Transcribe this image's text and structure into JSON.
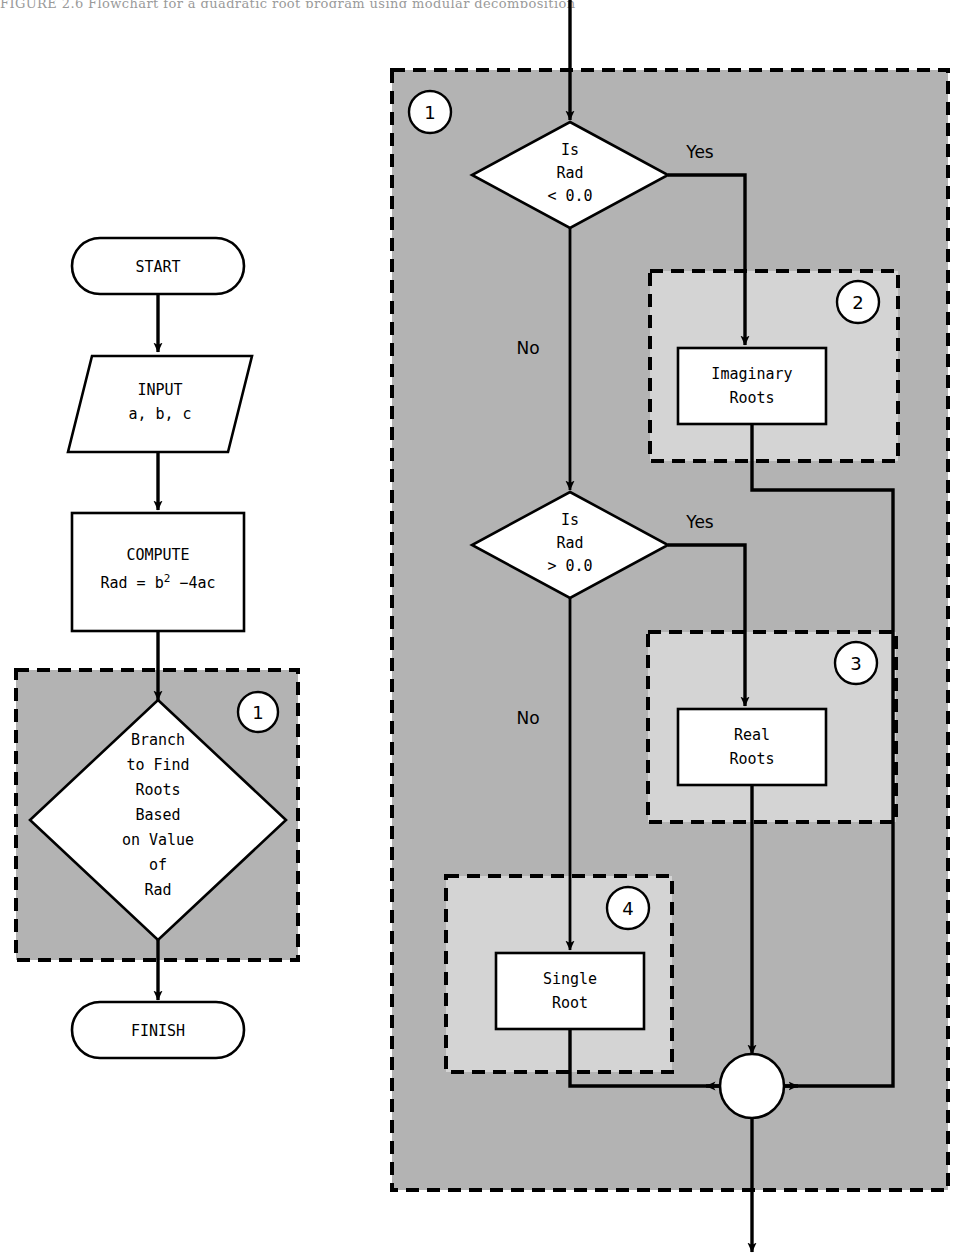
{
  "figure": {
    "caption_sliver": "FIGURE 2.6   Flowchart for a quadratic root program using modular decomposition",
    "background_color": "#ffffff",
    "region_dark_color": "#b3b3b3",
    "region_light_color": "#d4d4d4",
    "line_color": "#000000"
  },
  "left_chart": {
    "name": "top-level-flowchart",
    "nodes": {
      "start": {
        "label": "START",
        "shape": "terminator"
      },
      "input": {
        "label_line1": "INPUT",
        "label_line2": "a, b, c",
        "shape": "parallelogram"
      },
      "compute": {
        "label_line1": "COMPUTE",
        "label_line2_pre": "Rad = b",
        "label_line2_sup": "2",
        "label_line2_post": " −4ac",
        "shape": "process"
      },
      "branch": {
        "shape": "decision",
        "lines": [
          "Branch",
          "to Find",
          "Roots",
          "Based",
          "on Value",
          "of",
          "Rad"
        ]
      },
      "finish": {
        "label": "FINISH",
        "shape": "terminator"
      }
    },
    "region": {
      "number": "1",
      "style": "dark-dashed"
    }
  },
  "right_chart": {
    "name": "module-1-expansion",
    "region_outer": {
      "number": "1",
      "style": "dark-dashed"
    },
    "decisions": [
      {
        "id": "is-rad-lt-0",
        "lines": [
          "Is",
          "Rad",
          "< 0.0"
        ],
        "yes_label": "Yes",
        "no_label": "No"
      },
      {
        "id": "is-rad-gt-0",
        "lines": [
          "Is",
          "Rad",
          "> 0.0"
        ],
        "yes_label": "Yes",
        "no_label": "No"
      }
    ],
    "subregions": [
      {
        "number": "2",
        "style": "light-dashed",
        "box_line1": "Imaginary",
        "box_line2": "Roots"
      },
      {
        "number": "3",
        "style": "light-dashed",
        "box_line1": "Real",
        "box_line2": "Roots"
      },
      {
        "number": "4",
        "style": "light-dashed",
        "box_line1": "Single",
        "box_line2": "Root"
      }
    ],
    "junction": {
      "id": "merge-connector",
      "shape": "circle"
    }
  }
}
